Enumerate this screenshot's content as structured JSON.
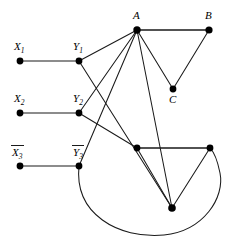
{
  "figure": {
    "name": "reduction-graph",
    "background": "#ffffff",
    "stroke_color": "#1a1a1a",
    "node_color": "#000000",
    "width": 226,
    "height": 244
  },
  "labels": {
    "x1": "X",
    "x1_sub": "1",
    "x2": "X",
    "x2_sub": "2",
    "x3": "X",
    "x3_sub": "3",
    "y1": "Y",
    "y1_sub": "1",
    "y2": "Y",
    "y2_sub": "2",
    "y3": "Y",
    "y3_sub": "3",
    "a": "A",
    "b": "B",
    "c": "C"
  },
  "nodes": [
    {
      "id": "x1",
      "label": "X1",
      "x": 20,
      "y": 61,
      "r": 3.4,
      "label_pos": "above"
    },
    {
      "id": "x2",
      "label": "X2",
      "x": 20,
      "y": 113,
      "r": 3.4,
      "label_pos": "above"
    },
    {
      "id": "x3",
      "label": "X3bar",
      "x": 20,
      "y": 166,
      "r": 3.4,
      "label_pos": "above"
    },
    {
      "id": "y1",
      "label": "Y1",
      "x": 79,
      "y": 61,
      "r": 3.4,
      "label_pos": "above"
    },
    {
      "id": "y2",
      "label": "Y2",
      "x": 79,
      "y": 113,
      "r": 3.4,
      "label_pos": "above"
    },
    {
      "id": "y3",
      "label": "Y3bar",
      "x": 79,
      "y": 166,
      "r": 3.4,
      "label_pos": "above"
    },
    {
      "id": "a",
      "label": "A",
      "x": 137,
      "y": 30,
      "r": 3.6,
      "label_pos": "above"
    },
    {
      "id": "b",
      "label": "B",
      "x": 209,
      "y": 30,
      "r": 3.6,
      "label_pos": "above"
    },
    {
      "id": "c",
      "label": "C",
      "x": 173,
      "y": 89,
      "r": 3.4,
      "label_pos": "below"
    },
    {
      "id": "d",
      "label": "",
      "x": 137,
      "y": 148,
      "r": 3.4,
      "label_pos": "none"
    },
    {
      "id": "e",
      "label": "",
      "x": 210,
      "y": 148,
      "r": 3.4,
      "label_pos": "none"
    },
    {
      "id": "f",
      "label": "",
      "x": 172,
      "y": 208,
      "r": 3.6,
      "label_pos": "none"
    }
  ],
  "edges": [
    {
      "from": "x1",
      "to": "y1",
      "type": "line"
    },
    {
      "from": "x2",
      "to": "y2",
      "type": "line"
    },
    {
      "from": "x3",
      "to": "y3",
      "type": "line"
    },
    {
      "from": "y1",
      "to": "a",
      "type": "line"
    },
    {
      "from": "y2",
      "to": "a",
      "type": "line"
    },
    {
      "from": "y3",
      "to": "a",
      "type": "line"
    },
    {
      "from": "y1",
      "to": "f",
      "type": "line"
    },
    {
      "from": "y2",
      "to": "d",
      "type": "line"
    },
    {
      "from": "a",
      "to": "b",
      "type": "line"
    },
    {
      "from": "a",
      "to": "c",
      "type": "line"
    },
    {
      "from": "b",
      "to": "c",
      "type": "line"
    },
    {
      "from": "a",
      "to": "f",
      "type": "line"
    },
    {
      "from": "d",
      "to": "e",
      "type": "line"
    },
    {
      "from": "d",
      "to": "f",
      "type": "line"
    },
    {
      "from": "e",
      "to": "f",
      "type": "line"
    },
    {
      "from": "y3",
      "to": "e",
      "type": "curve",
      "path": "M79,166 C 75,215 120,238 165,235 C 205,232 224,196 219,172 C 216,158 213,151 210,148"
    }
  ]
}
